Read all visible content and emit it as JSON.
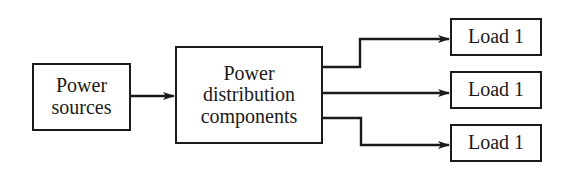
{
  "diagram": {
    "type": "block-diagram",
    "nodes": [
      {
        "id": "power-sources",
        "lines": [
          "Power",
          "sources"
        ]
      },
      {
        "id": "power-distribution",
        "lines": [
          "Power",
          "distribution",
          "components"
        ]
      },
      {
        "id": "load-top",
        "label": "Load 1"
      },
      {
        "id": "load-middle",
        "label": "Load 1"
      },
      {
        "id": "load-bottom",
        "label": "Load 1"
      }
    ],
    "edges": [
      {
        "from": "power-sources",
        "to": "power-distribution"
      },
      {
        "from": "power-distribution",
        "to": "load-top"
      },
      {
        "from": "power-distribution",
        "to": "load-middle"
      },
      {
        "from": "power-distribution",
        "to": "load-bottom"
      }
    ],
    "colors": {
      "stroke": "#1a1a1a",
      "background": "#ffffff"
    }
  }
}
